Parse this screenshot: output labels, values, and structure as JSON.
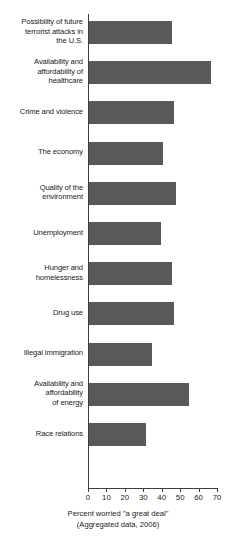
{
  "chart_data": {
    "type": "bar",
    "orientation": "horizontal",
    "title": "",
    "xlabel": "Percent worried \"a great deal\"",
    "xlabel_sub": "(Aggregated data, 2006)",
    "ylabel": "",
    "xlim": [
      0,
      70
    ],
    "xticks": [
      0,
      10,
      20,
      30,
      40,
      50,
      60,
      70
    ],
    "grid": false,
    "legend": null,
    "bar_color": "#595959",
    "axis_color": "#3d3d3d",
    "categories": [
      "Possibility of future terrorist attacks in the U.S.",
      "Availability and affordability of healthcare",
      "Crime and violence",
      "The economy",
      "Quality of the environment",
      "Unemployment",
      "Hunger and homelessness",
      "Drug use",
      "Illegal immigration",
      "Availability and affordability of energy",
      "Race relations"
    ],
    "values": [
      45,
      66,
      46,
      40,
      47,
      39,
      45,
      46,
      34,
      54,
      31
    ]
  },
  "chart": {
    "rows": [
      {
        "label_lines": [
          "Possibility of future",
          "terrorist attacks in",
          "the U.S."
        ],
        "value": 45
      },
      {
        "label_lines": [
          "Availability and",
          "affordability of",
          "healthcare"
        ],
        "value": 66
      },
      {
        "label_lines": [
          "Crime and violence"
        ],
        "value": 46
      },
      {
        "label_lines": [
          "The economy"
        ],
        "value": 40
      },
      {
        "label_lines": [
          "Quality of the",
          "environment"
        ],
        "value": 47
      },
      {
        "label_lines": [
          "Unemployment"
        ],
        "value": 39
      },
      {
        "label_lines": [
          "Hunger and",
          "homelessness"
        ],
        "value": 45
      },
      {
        "label_lines": [
          "Drug use"
        ],
        "value": 46
      },
      {
        "label_lines": [
          "Illegal immigration"
        ],
        "value": 34
      },
      {
        "label_lines": [
          "Availability and",
          "affordability",
          "of energy"
        ],
        "value": 54
      },
      {
        "label_lines": [
          "Race relations"
        ],
        "value": 31
      }
    ],
    "xticks": [
      "0",
      "10",
      "20",
      "30",
      "40",
      "50",
      "60",
      "70"
    ],
    "caption_line1": "Percent worried \"a great deal\"",
    "caption_line2": "(Aggregated data, 2006)"
  }
}
